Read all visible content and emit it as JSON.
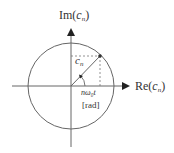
{
  "diagram": {
    "type": "complex-plane-phasor",
    "axes": {
      "vertical": {
        "label_prefix": "Im(",
        "label_var": "c",
        "label_sub": "n",
        "label_suffix": ")"
      },
      "horizontal": {
        "label_prefix": "Re(",
        "label_var": "c",
        "label_sub": "n",
        "label_suffix": ")"
      }
    },
    "phasor": {
      "label_var": "c",
      "label_sub": "n"
    },
    "angle": {
      "label": "nω₀t",
      "unit": "[rad]"
    },
    "colors": {
      "stroke": "#555555",
      "dashed": "#777777",
      "text": "#333333"
    }
  }
}
